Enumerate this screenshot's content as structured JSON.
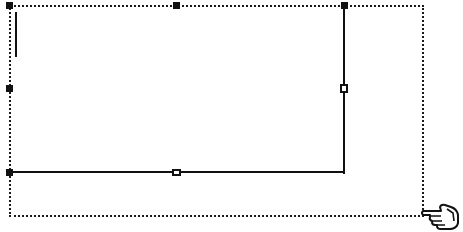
{
  "canvas": {
    "background": "#ffffff",
    "stroke_color": "#111111"
  },
  "selection_marquee": {
    "style": "dotted",
    "left": 9,
    "top": 5,
    "right": 423,
    "bottom": 215
  },
  "shape": {
    "type": "rectangle-resize",
    "vertical_edge": {
      "x": 344,
      "y1": 5,
      "y2": 173
    },
    "horizontal_edge": {
      "y": 172,
      "x1": 9,
      "x2": 345
    },
    "inner_line": {
      "x": 16,
      "y1": 12,
      "y2": 57
    }
  },
  "handles": [
    {
      "name": "top-left",
      "x": 9,
      "y": 5
    },
    {
      "name": "top-middle",
      "x": 176,
      "y": 5
    },
    {
      "name": "top-right",
      "x": 344,
      "y": 5
    },
    {
      "name": "middle-left",
      "x": 9,
      "y": 88
    },
    {
      "name": "middle-right",
      "x": 344,
      "y": 88
    },
    {
      "name": "bottom-left",
      "x": 9,
      "y": 172
    },
    {
      "name": "bottom-middle",
      "x": 176,
      "y": 172
    }
  ],
  "cursor": {
    "icon": "pointing-hand-icon",
    "x": 421,
    "y": 201
  }
}
